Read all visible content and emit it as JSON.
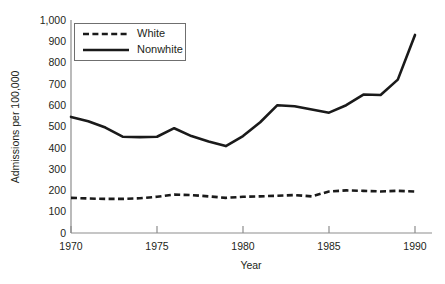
{
  "chart_data": {
    "type": "line",
    "title": "",
    "xlabel": "Year",
    "ylabel": "Admissions per 100,000",
    "xlim": [
      1970,
      1990
    ],
    "ylim": [
      0,
      1000
    ],
    "grid": false,
    "legend_position": "top-left",
    "x_ticks": [
      1970,
      1975,
      1980,
      1985,
      1990
    ],
    "x_tick_labels": [
      "1970",
      "1975",
      "1980",
      "1985",
      "1990"
    ],
    "y_ticks": [
      0,
      100,
      200,
      300,
      400,
      500,
      600,
      700,
      800,
      900,
      1000
    ],
    "y_tick_labels": [
      "0",
      "100",
      "200",
      "300",
      "400",
      "500",
      "600",
      "700",
      "800",
      "900",
      "1,000"
    ],
    "x": [
      1970,
      1971,
      1972,
      1973,
      1974,
      1975,
      1976,
      1977,
      1978,
      1979,
      1980,
      1981,
      1982,
      1983,
      1984,
      1985,
      1986,
      1987,
      1988,
      1989,
      1990
    ],
    "series": [
      {
        "name": "White",
        "style": "dashed",
        "color": "#1a1a1a",
        "values": [
          165,
          162,
          160,
          160,
          163,
          170,
          180,
          178,
          172,
          165,
          170,
          172,
          175,
          178,
          172,
          195,
          200,
          198,
          195,
          198,
          195
        ]
      },
      {
        "name": "Nonwhite",
        "style": "solid",
        "color": "#1a1a1a",
        "values": [
          545,
          525,
          495,
          452,
          450,
          452,
          492,
          455,
          430,
          408,
          455,
          520,
          600,
          595,
          580,
          565,
          600,
          650,
          648,
          720,
          930
        ]
      }
    ]
  },
  "legend": {
    "items": [
      {
        "label": "White",
        "style": "dashed"
      },
      {
        "label": "Nonwhite",
        "style": "solid"
      }
    ]
  }
}
